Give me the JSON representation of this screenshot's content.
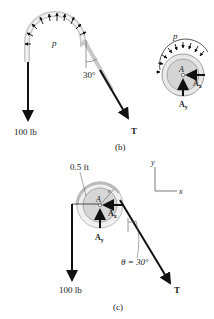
{
  "figure_b": {
    "caption": "(b)",
    "load_label": "100 lb",
    "tension_label": "T",
    "pressure_label": "p",
    "angle_label": "30°",
    "fbd_pressure_label": "p",
    "pin_label": "A",
    "ax_label": "A",
    "ax_sub": "x",
    "ay_label": "A",
    "ay_sub": "y"
  },
  "figure_c": {
    "caption": "(c)",
    "radius_label": "0.5 ft",
    "radius_symbol": "r",
    "pin_label": "A",
    "ax_label": "A",
    "ax_sub": "x",
    "ay_label": "A",
    "ay_sub": "y",
    "angle_label": "θ = 30°",
    "load_label": "100 lb",
    "tension_label": "T",
    "axis_x": "x",
    "axis_y": "y"
  },
  "colors": {
    "ink": "#111111",
    "drum_fill": "#d9d9d9",
    "drum_rim": "#eeeeee",
    "rope": "#bbbbbb"
  }
}
